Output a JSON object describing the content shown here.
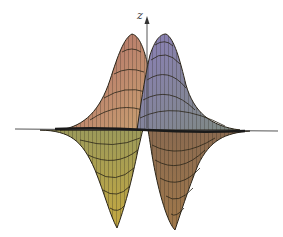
{
  "figure": {
    "type": "3d-surface-wireframe",
    "axis_label_z": "z",
    "lobes": [
      {
        "name": "upper-left-lobe",
        "direction": "positive",
        "color": "#b07a6e"
      },
      {
        "name": "upper-right-lobe",
        "direction": "positive",
        "color": "#8a84a6"
      },
      {
        "name": "lower-left-lobe",
        "direction": "negative",
        "color": "#b8a456"
      },
      {
        "name": "lower-right-lobe",
        "direction": "negative",
        "color": "#9c7a55"
      }
    ],
    "mesh_color": "#2a2418",
    "background": "#ffffff"
  }
}
